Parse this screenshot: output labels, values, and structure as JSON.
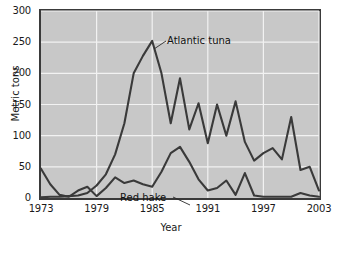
{
  "chart_data": {
    "type": "line",
    "title": "",
    "xlabel": "Year",
    "ylabel": "Metric tons",
    "xlim": [
      1973,
      2003
    ],
    "ylim": [
      0,
      300
    ],
    "grid": true,
    "legend_position": "inline-annotation",
    "x": [
      1973,
      1974,
      1975,
      1976,
      1977,
      1978,
      1979,
      1980,
      1981,
      1982,
      1983,
      1984,
      1985,
      1986,
      1987,
      1988,
      1989,
      1990,
      1991,
      1992,
      1993,
      1994,
      1995,
      1996,
      1997,
      1998,
      1999,
      2000,
      2001,
      2002,
      2003
    ],
    "xticks": [
      1973,
      1979,
      1985,
      1991,
      1997,
      2003
    ],
    "yticks": [
      0,
      50,
      100,
      150,
      200,
      250,
      300
    ],
    "series": [
      {
        "name": "Atlantic tuna",
        "color": "#3a3a3a",
        "values": [
          1,
          2,
          2,
          3,
          4,
          8,
          20,
          38,
          70,
          120,
          200,
          228,
          252,
          200,
          120,
          192,
          110,
          152,
          88,
          150,
          100,
          155,
          90,
          60,
          72,
          80,
          62,
          130,
          45,
          50,
          12
        ]
      },
      {
        "name": "Red hake",
        "color": "#3a3a3a",
        "values": [
          47,
          22,
          5,
          2,
          12,
          18,
          3,
          16,
          33,
          24,
          28,
          22,
          18,
          42,
          72,
          82,
          58,
          30,
          12,
          16,
          28,
          5,
          40,
          4,
          2,
          2,
          2,
          2,
          8,
          4,
          2
        ]
      }
    ]
  },
  "annotations": {
    "tuna_label": "Atlantic tuna",
    "hake_label": "Red hake"
  },
  "axes": {
    "y_title": "Metric tons",
    "x_title": "Year",
    "y_tick_labels": [
      "0",
      "50",
      "100",
      "150",
      "200",
      "250",
      "300"
    ],
    "x_tick_labels": [
      "1973",
      "1979",
      "1985",
      "1991",
      "1997",
      "2003"
    ]
  },
  "colors": {
    "plot_background": "#c8c8c8",
    "grid": "#f2f2f2",
    "frame": "#3a3a3a",
    "line": "#3a3a3a",
    "text": "#1a1a1a"
  }
}
